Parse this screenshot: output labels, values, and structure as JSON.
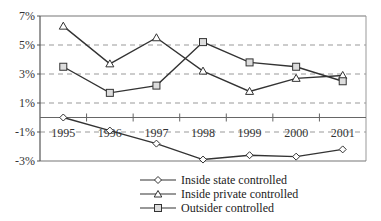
{
  "chart_data": {
    "type": "line",
    "title": "",
    "xlabel": "",
    "ylabel": "",
    "categories": [
      "1995",
      "1996",
      "1997",
      "1998",
      "1999",
      "2000",
      "2001"
    ],
    "yticks": [
      "7%",
      "5%",
      "3%",
      "1%",
      "-1%",
      "-3%"
    ],
    "ytick_values": [
      7,
      5,
      3,
      1,
      -1,
      -3
    ],
    "ylim": [
      -3,
      7
    ],
    "grid": "dashed horizontal",
    "legend_position": "bottom",
    "series": [
      {
        "name": "Inside state controlled",
        "marker": "diamond",
        "values": [
          0.0,
          -0.9,
          -1.8,
          -2.9,
          -2.6,
          -2.7,
          -2.2
        ]
      },
      {
        "name": "Inside private controlled",
        "marker": "triangle",
        "values": [
          6.3,
          3.7,
          5.5,
          3.2,
          1.8,
          2.7,
          2.9
        ]
      },
      {
        "name": "Outsider controlled",
        "marker": "square",
        "values": [
          3.5,
          1.7,
          2.2,
          5.2,
          3.8,
          3.5,
          2.5
        ]
      }
    ]
  },
  "legend": {
    "items": [
      {
        "label": "Inside state controlled"
      },
      {
        "label": "Inside private controlled"
      },
      {
        "label": "Outsider controlled"
      }
    ]
  }
}
